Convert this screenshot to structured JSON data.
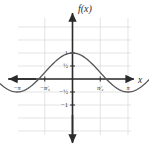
{
  "figure": {
    "function_label": "f(x)",
    "x_axis_label": "x",
    "background_color": "#ffffff",
    "grid_color": "#d8d8d8",
    "axis_color": "#2b2b2b",
    "curve_color": "#555555"
  },
  "axes": {
    "x_ticks": [
      {
        "value": -6.2832,
        "label": "−2π"
      },
      {
        "value": -4.7124,
        "label": "−³⁄₂π"
      },
      {
        "value": -3.1416,
        "label": "−π"
      },
      {
        "value": -1.5708,
        "label": "−π⁄₂"
      },
      {
        "value": 1.5708,
        "label": "π⁄₂"
      },
      {
        "value": 3.1416,
        "label": "π"
      },
      {
        "value": 4.7124,
        "label": "³⁄₂π"
      },
      {
        "value": 6.2832,
        "label": "2π"
      }
    ],
    "y_ticks": [
      {
        "value": 1,
        "label": "1"
      },
      {
        "value": 0.5,
        "label": "½"
      },
      {
        "value": -0.5,
        "label": "−½"
      },
      {
        "value": -1,
        "label": "−1"
      }
    ],
    "xlim": [
      -8.2,
      8.2
    ],
    "ylim": [
      -2.2,
      2.2
    ],
    "grid": true
  },
  "chart_data": {
    "type": "line",
    "title": "",
    "subtitle": "",
    "xlabel": "x",
    "ylabel": "f(x)",
    "xlim": [
      -8.2,
      8.2
    ],
    "ylim": [
      -2.2,
      2.2
    ],
    "grid": true,
    "legend": null,
    "legend_position": "none",
    "annotations": [
      {
        "text": "f(x)",
        "x": 0,
        "y": 2.1,
        "role": "y-axis-name"
      },
      {
        "text": "x",
        "x": 8.0,
        "y": 0,
        "role": "x-axis-name"
      }
    ],
    "series": [
      {
        "name": "f",
        "description": "cosine-like wave, amplitude about 0.75, vertical offset about 0.25, period 2π, maximum 1 at x=0 and x=±2π, minimum about −0.5 at x=±π",
        "equation": "f(x) = 0.75*cos(x) + 0.25",
        "amplitude": 0.75,
        "offset": 0.25,
        "period": 6.2832,
        "max": 1,
        "min": -0.5,
        "x": [
          -7.4,
          -7.0,
          -6.6,
          -6.2832,
          -6.0,
          -5.5,
          -5.0,
          -4.7124,
          -4.5,
          -4.0,
          -3.5,
          -3.1416,
          -2.8,
          -2.4,
          -2.0,
          -1.5708,
          -1.2,
          -0.8,
          -0.4,
          0,
          0.4,
          0.8,
          1.2,
          1.5708,
          2.0,
          2.4,
          2.8,
          3.1416,
          3.5,
          4.0,
          4.5,
          4.7124,
          5.0,
          5.5,
          6.0,
          6.2832,
          6.6,
          7.0,
          7.4
        ],
        "y": [
          0.65,
          0.82,
          0.96,
          1.0,
          0.97,
          0.78,
          0.46,
          0.25,
          0.09,
          -0.24,
          -0.45,
          -0.5,
          -0.47,
          -0.3,
          -0.06,
          0.25,
          0.52,
          0.77,
          0.94,
          1.0,
          0.94,
          0.77,
          0.52,
          0.25,
          -0.06,
          -0.3,
          -0.47,
          -0.5,
          -0.45,
          -0.24,
          0.09,
          0.25,
          0.46,
          0.78,
          0.97,
          1.0,
          0.96,
          0.82,
          0.65
        ],
        "endpoint_arrows": [
          "left",
          "right"
        ]
      }
    ]
  }
}
